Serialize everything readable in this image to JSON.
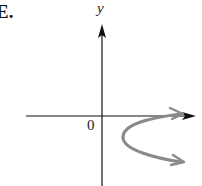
{
  "option": {
    "label": "E."
  },
  "axes": {
    "y_label": "y",
    "x_label": "",
    "origin_label": "0",
    "axis_color": "#111111"
  },
  "curve": {
    "description": "Leftward-opening... parabola-like curve opening to the right, vertex below x-axis right of origin, with arrowheads on both ends",
    "color": "#888888",
    "start_arrow": "upper-right",
    "end_arrow": "lower-right"
  }
}
